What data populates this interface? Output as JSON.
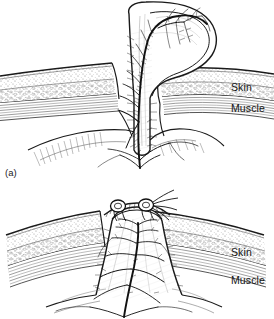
{
  "figure": {
    "kind": "anatomical-line-illustration",
    "width": 274,
    "height": 319,
    "background_color": "#ffffff",
    "ink_color": "#1a1a1a",
    "stipple_color": "#5a5a5a",
    "panel_count": 2
  },
  "panels": [
    {
      "id": "a",
      "caption": "(a)",
      "description": "Flap raised on its vascular pedicle above the skin and muscle layers",
      "labels": [
        {
          "name": "skin",
          "text": "Skin"
        },
        {
          "name": "muscle",
          "text": "Muscle"
        }
      ],
      "features": [
        "elevated-tissue-flap",
        "vascular-pedicle",
        "branching-vascular-tree",
        "epidermis-line",
        "stippled-dermis-fat-layer",
        "striated-muscle-layer",
        "wound-bed"
      ]
    },
    {
      "id": "b",
      "caption": "",
      "description": "Flap inset into the defect and closed with sutures",
      "labels": [
        {
          "name": "skin",
          "text": "Skin"
        },
        {
          "name": "muscle",
          "text": "Muscle"
        }
      ],
      "features": [
        "inset-tissue-flap",
        "suture-knots",
        "suture-thread-tails",
        "branching-vascular-tree",
        "epidermis-line",
        "stippled-dermis-fat-layer",
        "striated-muscle-layer"
      ]
    }
  ]
}
